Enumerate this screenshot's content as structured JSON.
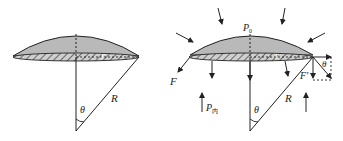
{
  "figure": {
    "colors": {
      "cap_fill": "#b9b9b9",
      "stroke": "#222222",
      "background": "#ffffff"
    },
    "left_panel": {
      "labels": {
        "radius_small": "r",
        "radius_large": "R",
        "angle": "θ"
      }
    },
    "right_panel": {
      "labels": {
        "outer_pressure": "P",
        "outer_pressure_sub": "0",
        "inner_pressure": "P",
        "inner_pressure_sub": "内",
        "force_left": "F",
        "force_right": "F′",
        "radius_small": "r",
        "radius_large": "R",
        "angle": "θ",
        "angle_corner": "θ"
      }
    }
  }
}
